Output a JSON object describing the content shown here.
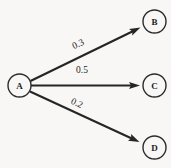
{
  "diagram": {
    "type": "node-link-diagram",
    "background_color": "#f8f7f5",
    "stroke_color": "#252525",
    "node_fill": "#f8f7f5",
    "canvas": {
      "width": 171,
      "height": 168
    },
    "nodes": [
      {
        "id": "A",
        "label": "A",
        "cx": 19.5,
        "cy": 85.5,
        "r": 11.5
      },
      {
        "id": "B",
        "label": "B",
        "cx": 154.5,
        "cy": 21.5,
        "r": 11.5
      },
      {
        "id": "C",
        "label": "C",
        "cx": 154.5,
        "cy": 85.5,
        "r": 11.5
      },
      {
        "id": "D",
        "label": "D",
        "cx": 154.5,
        "cy": 147.5,
        "r": 11.5
      }
    ],
    "edges": [
      {
        "id": "A-B",
        "from": "A",
        "to": "B",
        "weight": "0.3",
        "x1": 30.5,
        "y1": 81.0,
        "x2": 140.5,
        "y2": 27.5,
        "label_x": 78,
        "label_y": 44,
        "label_rotation": -26
      },
      {
        "id": "A-C",
        "from": "A",
        "to": "C",
        "weight": "0.5",
        "x1": 31.0,
        "y1": 85.5,
        "x2": 140.0,
        "y2": 85.5,
        "label_x": 82,
        "label_y": 70,
        "label_rotation": 0
      },
      {
        "id": "A-D",
        "from": "A",
        "to": "D",
        "weight": "0.2",
        "x1": 30.0,
        "y1": 91.5,
        "x2": 139.5,
        "y2": 142.0,
        "label_x": 77,
        "label_y": 103,
        "label_rotation": 25
      }
    ]
  }
}
